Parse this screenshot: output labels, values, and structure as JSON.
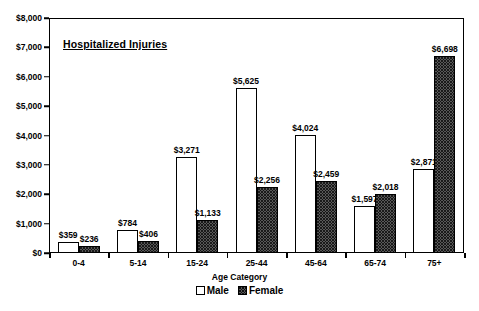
{
  "chart_data": {
    "type": "bar",
    "title": "Hospitalized Injuries",
    "xlabel": "Age Category",
    "ylabel": "",
    "ylim": [
      0,
      8000
    ],
    "ytick_labels": [
      "$0",
      "$1,000",
      "$2,000",
      "$3,000",
      "$4,000",
      "$5,000",
      "$6,000",
      "$7,000",
      "$8,000"
    ],
    "ytick_values": [
      0,
      1000,
      2000,
      3000,
      4000,
      5000,
      6000,
      7000,
      8000
    ],
    "grid": false,
    "legend_position": "bottom",
    "categories": [
      "0-4",
      "5-14",
      "15-24",
      "25-44",
      "45-64",
      "65-74",
      "75+"
    ],
    "series": [
      {
        "name": "Male",
        "values": [
          359,
          784,
          3271,
          5625,
          4024,
          1597,
          2871
        ],
        "labels": [
          "$359",
          "$784",
          "$3,271",
          "$5,625",
          "$4,024",
          "$1,597",
          "$2,871"
        ],
        "pattern": "light-dotted",
        "color": "#ffffff"
      },
      {
        "name": "Female",
        "values": [
          236,
          406,
          1133,
          2256,
          2459,
          2018,
          6698
        ],
        "labels": [
          "$236",
          "$406",
          "$1,133",
          "$2,256",
          "$2,459",
          "$2,018",
          "$6,698"
        ],
        "pattern": "dark-crosshatch",
        "color": "#585858"
      }
    ]
  },
  "legend": {
    "items": [
      {
        "label": "Male"
      },
      {
        "label": "Female"
      }
    ]
  }
}
